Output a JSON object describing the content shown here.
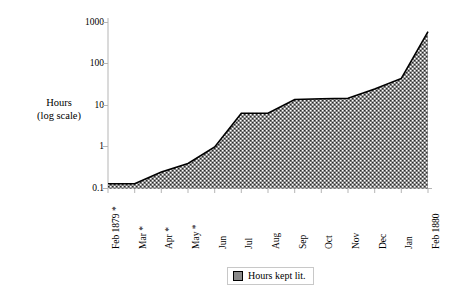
{
  "chart_data": {
    "type": "area",
    "title": "",
    "xlabel": "",
    "ylabel": "Hours\n(log scale)",
    "ylabel_line1": "Hours",
    "ylabel_line2": "(log  scale)",
    "yscale": "log",
    "ylim": [
      0.1,
      1000
    ],
    "ytick_labels": [
      "1000",
      "100",
      "10",
      "1",
      "0.1"
    ],
    "ytick_values": [
      1000,
      100,
      10,
      1,
      0.1
    ],
    "grid": false,
    "categories": [
      "Feb 1879 *",
      "Mar *",
      "Apr *",
      "May *",
      "Jun",
      "Jul",
      "Aug",
      "Sep",
      "Oct",
      "Nov",
      "Dec",
      "Jan",
      "Feb 1880"
    ],
    "series": [
      {
        "name": "Hours kept lit.",
        "values": [
          0.13,
          0.13,
          0.25,
          0.4,
          1.0,
          6.5,
          6.5,
          14,
          14.5,
          15,
          25,
          45,
          600
        ]
      }
    ],
    "legend": {
      "position": "bottom-center",
      "entries": [
        {
          "label": "Hours kept lit.",
          "swatch": "checkered-pattern-swatch"
        }
      ]
    }
  },
  "legend": {
    "label": "Hours kept lit."
  },
  "axes": {
    "y_title_line1": "Hours",
    "y_title_line2": "(log  scale)"
  },
  "colors": {
    "line": "#000000",
    "fill": "#8a8a8a",
    "axis": "#b5b5b5",
    "background": "#ffffff"
  }
}
